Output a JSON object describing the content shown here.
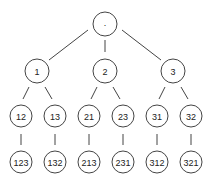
{
  "diagram": {
    "type": "tree",
    "nodes": [
      {
        "id": "root",
        "label": "·",
        "x": 105,
        "y": 24,
        "r": 12
      },
      {
        "id": "n1",
        "label": "1",
        "x": 37,
        "y": 71,
        "r": 12
      },
      {
        "id": "n2",
        "label": "2",
        "x": 105,
        "y": 71,
        "r": 12
      },
      {
        "id": "n3",
        "label": "3",
        "x": 173,
        "y": 71,
        "r": 12
      },
      {
        "id": "n12",
        "label": "12",
        "x": 21,
        "y": 116,
        "r": 11
      },
      {
        "id": "n13",
        "label": "13",
        "x": 55,
        "y": 116,
        "r": 11
      },
      {
        "id": "n21",
        "label": "21",
        "x": 89,
        "y": 116,
        "r": 11
      },
      {
        "id": "n23",
        "label": "23",
        "x": 123,
        "y": 116,
        "r": 11
      },
      {
        "id": "n31",
        "label": "31",
        "x": 157,
        "y": 116,
        "r": 11
      },
      {
        "id": "n32",
        "label": "32",
        "x": 191,
        "y": 116,
        "r": 11
      },
      {
        "id": "n123",
        "label": "123",
        "x": 21,
        "y": 162,
        "r": 11
      },
      {
        "id": "n132",
        "label": "132",
        "x": 55,
        "y": 162,
        "r": 11
      },
      {
        "id": "n213",
        "label": "213",
        "x": 89,
        "y": 162,
        "r": 11
      },
      {
        "id": "n231",
        "label": "231",
        "x": 123,
        "y": 162,
        "r": 11
      },
      {
        "id": "n312",
        "label": "312",
        "x": 157,
        "y": 162,
        "r": 11
      },
      {
        "id": "n321",
        "label": "321",
        "x": 191,
        "y": 162,
        "r": 11
      }
    ],
    "edges": [
      {
        "from": "root",
        "to": "n1",
        "x1": 88,
        "y1": 30,
        "x2": 49,
        "y2": 60
      },
      {
        "from": "root",
        "to": "n2",
        "x1": 105,
        "y1": 40,
        "x2": 105,
        "y2": 52
      },
      {
        "from": "root",
        "to": "n3",
        "x1": 122,
        "y1": 30,
        "x2": 161,
        "y2": 60
      },
      {
        "from": "n1",
        "to": "n12",
        "x1": 29,
        "y1": 87,
        "x2": 23,
        "y2": 99
      },
      {
        "from": "n1",
        "to": "n13",
        "x1": 45,
        "y1": 87,
        "x2": 52,
        "y2": 99
      },
      {
        "from": "n2",
        "to": "n21",
        "x1": 97,
        "y1": 87,
        "x2": 91,
        "y2": 99
      },
      {
        "from": "n2",
        "to": "n23",
        "x1": 113,
        "y1": 87,
        "x2": 120,
        "y2": 99
      },
      {
        "from": "n3",
        "to": "n31",
        "x1": 165,
        "y1": 87,
        "x2": 159,
        "y2": 99
      },
      {
        "from": "n3",
        "to": "n32",
        "x1": 181,
        "y1": 87,
        "x2": 188,
        "y2": 99
      },
      {
        "from": "n12",
        "to": "n123",
        "x1": 21,
        "y1": 134,
        "x2": 21,
        "y2": 145
      },
      {
        "from": "n13",
        "to": "n132",
        "x1": 55,
        "y1": 134,
        "x2": 55,
        "y2": 145
      },
      {
        "from": "n21",
        "to": "n213",
        "x1": 89,
        "y1": 134,
        "x2": 89,
        "y2": 145
      },
      {
        "from": "n23",
        "to": "n231",
        "x1": 123,
        "y1": 134,
        "x2": 123,
        "y2": 145
      },
      {
        "from": "n31",
        "to": "n312",
        "x1": 157,
        "y1": 134,
        "x2": 157,
        "y2": 145
      },
      {
        "from": "n32",
        "to": "n321",
        "x1": 191,
        "y1": 134,
        "x2": 191,
        "y2": 145
      }
    ]
  }
}
